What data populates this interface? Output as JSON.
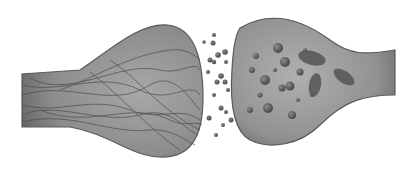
{
  "image": {
    "subject": "synapse",
    "description": "Grayscale 3D render of a neural synapse: presynaptic terminal on the left with fibrous strands, synaptic cleft with scattered vesicles/particles, postsynaptic bulb on the right with spherical vesicles and mitochondria",
    "colors": {
      "background": "#ffffff",
      "membrane": "#7a7a7a",
      "membrane_dark": "#555555",
      "interior": "#9a9a9a",
      "fibers": "#4a4a4a",
      "vesicles": "#5a5a5a"
    }
  }
}
